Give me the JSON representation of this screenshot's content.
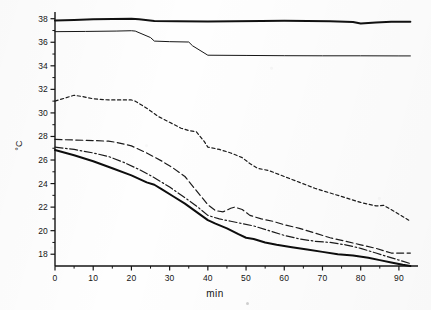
{
  "chart_data": {
    "type": "line",
    "title": "",
    "xlabel": "min",
    "ylabel": "°C",
    "xlim": [
      0,
      95
    ],
    "ylim": [
      17,
      38.4
    ],
    "grid": false,
    "legend": "none",
    "xticks": [
      0,
      10,
      20,
      30,
      40,
      50,
      60,
      70,
      80,
      90
    ],
    "xtick_labels": [
      "0",
      "10",
      "20",
      "30",
      "40",
      "50",
      "60",
      "70",
      "80",
      "90"
    ],
    "yticks": [
      18,
      20,
      22,
      24,
      26,
      28,
      30,
      32,
      34,
      36,
      38
    ],
    "ytick_labels": [
      "18",
      "20",
      "22",
      "24",
      "26",
      "28",
      "30",
      "32",
      "34",
      "36",
      "38"
    ],
    "yminorticks": [
      19,
      21,
      23,
      25,
      27,
      29,
      31,
      33,
      35,
      37
    ],
    "axis_color": "#141414",
    "series": [
      {
        "name": "core-temperature-upper",
        "style": "solid",
        "linewidth": 2.0,
        "color": "#111111",
        "x": [
          0,
          5,
          10,
          15,
          20,
          22,
          26,
          32,
          40,
          47,
          54,
          60,
          66,
          72,
          78,
          80,
          84,
          88,
          93
        ],
        "y": [
          37.85,
          37.9,
          37.95,
          37.98,
          38.0,
          37.95,
          37.8,
          37.78,
          37.77,
          37.78,
          37.8,
          37.82,
          37.8,
          37.78,
          37.72,
          37.6,
          37.68,
          37.75,
          37.75
        ]
      },
      {
        "name": "temperature-step-line",
        "style": "solid",
        "linewidth": 1.0,
        "color": "#161616",
        "x": [
          0,
          8,
          16,
          20,
          21,
          25,
          26,
          30,
          35,
          36,
          39,
          40,
          50,
          60,
          70,
          80,
          90,
          93
        ],
        "y": [
          36.9,
          36.92,
          36.95,
          36.98,
          36.95,
          36.4,
          36.1,
          36.05,
          36.02,
          35.7,
          35.1,
          34.9,
          34.88,
          34.86,
          34.85,
          34.85,
          34.84,
          34.84
        ]
      },
      {
        "name": "dotted-temperature-curve",
        "style": "dotted",
        "linewidth": 1.2,
        "color": "#1b1b1b",
        "x": [
          0,
          3,
          5,
          7,
          10,
          14,
          17,
          20,
          21,
          24,
          27,
          30,
          33,
          35,
          37,
          39,
          40,
          43,
          46,
          49,
          51,
          53,
          56,
          60,
          64,
          68,
          72,
          76,
          80,
          84,
          86,
          89,
          93
        ],
        "y": [
          31.0,
          31.3,
          31.5,
          31.4,
          31.2,
          31.1,
          31.1,
          31.1,
          31.0,
          30.4,
          29.7,
          29.2,
          28.7,
          28.5,
          28.4,
          27.6,
          27.1,
          26.9,
          26.6,
          26.2,
          25.7,
          25.3,
          25.1,
          24.6,
          24.1,
          23.6,
          23.2,
          22.8,
          22.4,
          22.1,
          22.15,
          21.6,
          20.8
        ]
      },
      {
        "name": "dashed-temperature-curve",
        "style": "dashed",
        "linewidth": 1.2,
        "color": "#1b1b1b",
        "x": [
          0,
          5,
          10,
          14,
          16,
          20,
          24,
          28,
          31,
          34,
          37,
          40,
          42,
          44,
          46,
          47,
          49,
          51,
          54,
          57,
          60,
          64,
          68,
          72,
          76,
          80,
          84,
          86,
          88,
          90,
          93
        ],
        "y": [
          27.75,
          27.7,
          27.65,
          27.6,
          27.5,
          27.2,
          26.6,
          25.9,
          25.3,
          24.6,
          23.4,
          22.2,
          21.7,
          21.6,
          21.9,
          22.0,
          21.8,
          21.3,
          21.0,
          20.8,
          20.5,
          20.2,
          19.8,
          19.4,
          19.1,
          18.8,
          18.5,
          18.3,
          18.1,
          18.1,
          18.1
        ]
      },
      {
        "name": "dash-dot-temperature-curve",
        "style": "dashdot",
        "linewidth": 1.2,
        "color": "#1b1b1b",
        "x": [
          0,
          5,
          10,
          14,
          18,
          22,
          26,
          30,
          34,
          37,
          40,
          43,
          46,
          49,
          52,
          56,
          60,
          64,
          68,
          72,
          76,
          80,
          84,
          87,
          90,
          93
        ],
        "y": [
          27.1,
          26.9,
          26.6,
          26.3,
          25.8,
          25.2,
          24.5,
          23.7,
          22.8,
          22.1,
          21.3,
          21.0,
          20.8,
          20.6,
          20.4,
          20.0,
          19.6,
          19.3,
          19.1,
          19.0,
          18.8,
          18.5,
          18.1,
          17.8,
          17.5,
          17.2
        ]
      },
      {
        "name": "thick-solid-lower-curve",
        "style": "solid",
        "linewidth": 2.0,
        "color": "#0d0d0d",
        "x": [
          0,
          5,
          10,
          15,
          20,
          24,
          26,
          28,
          31,
          34,
          37,
          40,
          42,
          45,
          48,
          50,
          52,
          55,
          58,
          62,
          66,
          70,
          74,
          78,
          82,
          85,
          88,
          91,
          93
        ],
        "y": [
          26.85,
          26.4,
          25.9,
          25.3,
          24.7,
          24.1,
          23.9,
          23.5,
          22.9,
          22.3,
          21.6,
          20.9,
          20.6,
          20.2,
          19.7,
          19.4,
          19.3,
          19.0,
          18.8,
          18.6,
          18.4,
          18.2,
          18.0,
          17.9,
          17.7,
          17.5,
          17.3,
          17.1,
          17.0
        ]
      }
    ]
  },
  "axis_titles": {
    "y": "°C",
    "x": "min"
  }
}
